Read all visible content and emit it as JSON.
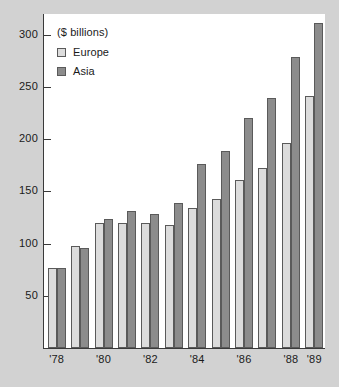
{
  "chart_data": {
    "type": "bar",
    "title": "",
    "subtitle": "",
    "unit_note": "($ billions)",
    "xlabel": "",
    "ylabel": "",
    "ylim": [
      0,
      320
    ],
    "yticks": [
      50,
      100,
      150,
      200,
      250,
      300
    ],
    "ytick_labels": [
      "50",
      "100",
      "150",
      "200",
      "250",
      "300"
    ],
    "grid": false,
    "legend_position": "top-left",
    "categories": [
      "'78",
      "'79",
      "'80",
      "'81",
      "'82",
      "'83",
      "'84",
      "'85",
      "'86",
      "'87",
      "'88",
      "'89"
    ],
    "visible_tick_labels": [
      "'78",
      "'80",
      "'82",
      "'84",
      "'86",
      "'88",
      "'89"
    ],
    "tick_label_indices": [
      0,
      2,
      4,
      6,
      8,
      10,
      11
    ],
    "series": [
      {
        "name": "Europe",
        "color": "#dcdcdc",
        "values": [
          77,
          98,
          120,
          120,
          120,
          118,
          134,
          143,
          161,
          172,
          196,
          241
        ]
      },
      {
        "name": "Asia",
        "color": "#8c8c8c",
        "values": [
          77,
          96,
          124,
          131,
          128,
          139,
          176,
          189,
          220,
          240,
          279,
          311
        ]
      }
    ]
  },
  "legend": {
    "title": "($ billions)",
    "entries": [
      {
        "label": "Europe",
        "swatch": "europe"
      },
      {
        "label": "Asia",
        "swatch": "asia"
      }
    ]
  },
  "colors": {
    "background": "#d2d2d2",
    "panel": "#ffffff",
    "axis": "#3a3a3a",
    "europe": "#dcdcdc",
    "asia": "#8c8c8c",
    "bar_outline": "#5a5a5a",
    "text": "#1a1a1a"
  }
}
